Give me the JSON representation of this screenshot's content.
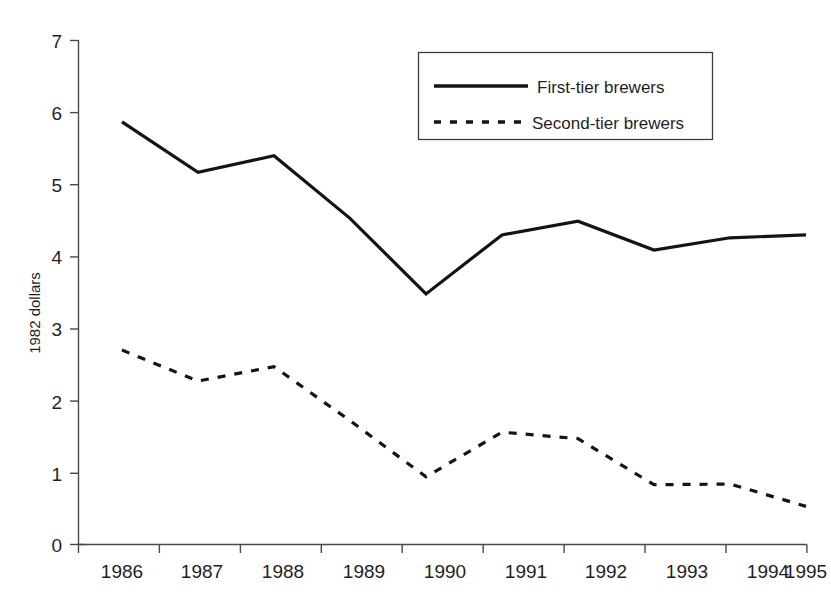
{
  "chart_data": {
    "type": "line",
    "title": "",
    "subtitle": "",
    "xlabel": "",
    "ylabel": "1982 dollars",
    "categories": [
      "1986",
      "1987",
      "1988",
      "1989",
      "1990",
      "1991",
      "1992",
      "1993",
      "1994",
      "1995"
    ],
    "x": [
      1986,
      1987,
      1988,
      1989,
      1990,
      1991,
      1992,
      1993,
      1994,
      1995
    ],
    "ylim": [
      0,
      7
    ],
    "yticks": [
      0,
      1,
      2,
      3,
      4,
      5,
      6,
      7
    ],
    "ytick_labels": [
      "0",
      "1",
      "2",
      "3",
      "4",
      "5",
      "6",
      "7"
    ],
    "grid": false,
    "legend_position": "top-right",
    "series": [
      {
        "name": "First-tier brewers",
        "style": "solid",
        "color": "#141414",
        "values": [
          5.87,
          5.17,
          5.4,
          4.53,
          3.48,
          4.3,
          4.49,
          4.09,
          4.26,
          4.3
        ]
      },
      {
        "name": "Second-tier brewers",
        "style": "dashed",
        "color": "#141414",
        "values": [
          2.7,
          2.27,
          2.47,
          1.72,
          0.94,
          1.56,
          1.47,
          0.83,
          0.84,
          0.53
        ]
      }
    ]
  },
  "axes": {
    "y_axis_title": "1982 dollars",
    "y_tick_labels": [
      "7",
      "6",
      "5",
      "4",
      "3",
      "2",
      "1",
      "0"
    ],
    "x_tick_labels": [
      "1986",
      "1987",
      "1988",
      "1989",
      "1990",
      "1991",
      "1992",
      "1993",
      "1994",
      "1995"
    ]
  },
  "legend": {
    "items": [
      {
        "label": "First-tier brewers",
        "style": "solid"
      },
      {
        "label": "Second-tier brewers",
        "style": "dashed"
      }
    ]
  }
}
